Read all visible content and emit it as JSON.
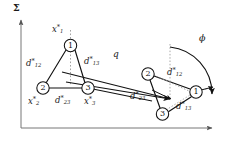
{
  "figure": {
    "frame_label": "Σ",
    "transform_label": "q",
    "angle_label": "ϕ",
    "axes": {
      "vertical_axis_name": "vertical-axis",
      "horizontal_axis_name": "horizontal-axis"
    },
    "formation_reference": {
      "name": "reference-formation",
      "nodes": [
        {
          "id": "1",
          "label": "1",
          "cx": 70.5,
          "cy": 45.5,
          "r": 6.2,
          "position_label_main": "x",
          "position_label_sub": "1",
          "position_label_star": "*",
          "position_label_x": 52,
          "position_label_y": 24
        },
        {
          "id": "2",
          "label": "2",
          "cx": 43.0,
          "cy": 88.0,
          "r": 6.2,
          "position_label_main": "x",
          "position_label_sub": "2",
          "position_label_star": "*",
          "position_label_x": 28,
          "position_label_y": 97
        },
        {
          "id": "3",
          "label": "3",
          "cx": 88.0,
          "cy": 88.0,
          "r": 6.2,
          "position_label_main": "x",
          "position_label_sub": "3",
          "position_label_star": "*",
          "position_label_x": 84,
          "position_label_y": 97
        }
      ],
      "edges": [
        {
          "from": "1",
          "to": "2",
          "label_main": "d",
          "label_sub": "12",
          "label_star": "*",
          "label_x": 26,
          "label_y": 60
        },
        {
          "from": "1",
          "to": "3",
          "label_main": "d",
          "label_sub": "13",
          "label_star": "*",
          "label_x": 84,
          "label_y": 58
        },
        {
          "from": "2",
          "to": "3",
          "label_main": "d",
          "label_sub": "23",
          "label_star": "*",
          "label_x": 55,
          "label_y": 97
        }
      ]
    },
    "formation_transformed": {
      "name": "transformed-formation",
      "nodes": [
        {
          "id": "1",
          "label": "1",
          "cx": 196.0,
          "cy": 92.0,
          "r": 6.2
        },
        {
          "id": "2",
          "label": "2",
          "cx": 148.0,
          "cy": 74.0,
          "r": 6.2
        },
        {
          "id": "3",
          "label": "3",
          "cx": 162.5,
          "cy": 114.0,
          "r": 6.2
        }
      ],
      "edges": [
        {
          "from": "1",
          "to": "2",
          "label_main": "d",
          "label_sub": "12",
          "label_star": "*",
          "label_x": 167,
          "label_y": 69
        },
        {
          "from": "1",
          "to": "3",
          "label_main": "d",
          "label_sub": "13",
          "label_star": "*",
          "label_x": 176,
          "label_y": 103
        },
        {
          "from": "2",
          "to": "3",
          "label_main": "d",
          "label_sub": "23",
          "label_star": "*",
          "label_x": 133,
          "label_y": 93
        }
      ]
    },
    "transform_label_x": 113,
    "transform_label_y": 53,
    "angle_label_x": 199,
    "angle_label_y": 36,
    "frame_label_x": 13,
    "frame_label_y": 5
  }
}
